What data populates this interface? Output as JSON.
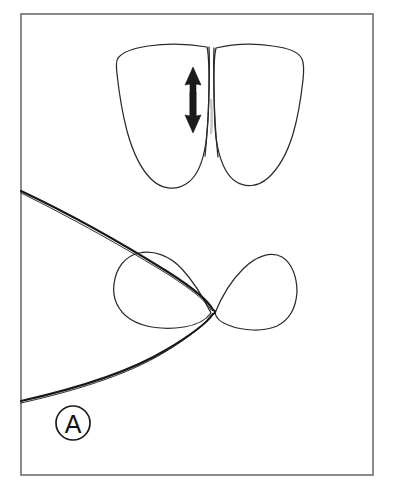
{
  "figure": {
    "panel_label": "A",
    "caption_visible": false,
    "background_color": "#ffffff",
    "frame": {
      "stroke_color": "#6e6e72",
      "x": 21,
      "y": 14,
      "width": 352,
      "height": 461
    },
    "ink_color": "#2a2a2c",
    "accent_color": "#17171a"
  },
  "upper_view": {
    "name": "proximal-teeth-facial-view",
    "teeth": [
      {
        "id": "left-tooth",
        "label": "left tooth crown",
        "bounds": {
          "x": 116,
          "y": 45,
          "width": 96,
          "height": 145
        }
      },
      {
        "id": "right-tooth",
        "label": "right tooth crown",
        "bounds": {
          "x": 213,
          "y": 46,
          "width": 91,
          "height": 143
        }
      }
    ],
    "arrow": {
      "id": "vertical-double-arrow",
      "label": "double-headed vertical arrow",
      "direction": "up-down",
      "color": "#1a1a1c",
      "x": 193,
      "y_top": 67,
      "y_bottom": 133
    }
  },
  "lower_view": {
    "name": "tooth-cross-section-occlusal-view",
    "sections": [
      {
        "id": "left-section",
        "label": "left tooth cross-section",
        "bounds": {
          "x": 114,
          "y": 252,
          "width": 98,
          "height": 76
        }
      },
      {
        "id": "right-section",
        "label": "right tooth cross-section",
        "bounds": {
          "x": 211,
          "y": 251,
          "width": 86,
          "height": 79
        }
      }
    ],
    "band": {
      "id": "matrix-band",
      "label": "matrix band looped around left tooth",
      "color": "#17171a",
      "entry_upper": {
        "x": 21,
        "y": 191
      },
      "entry_lower": {
        "x": 21,
        "y": 401
      },
      "apex": {
        "x": 214,
        "y": 311
      }
    }
  },
  "label_badge": {
    "text": "A",
    "center_x": 73,
    "center_y": 423,
    "radius": 17,
    "stroke_color": "#1a1a1c"
  }
}
